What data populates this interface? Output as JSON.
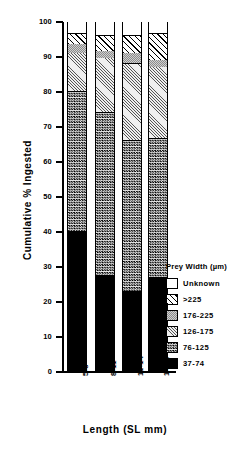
{
  "chart_data": {
    "type": "bar",
    "subtype": "stacked-100-percent",
    "title": "",
    "xlabel": "Length (SL mm)",
    "ylabel": "Cumulative % Ingested",
    "categories": [
      "5-8",
      "8-11",
      "11-14",
      "14-17"
    ],
    "ylim": [
      0,
      100
    ],
    "ytick_labels": [
      "0",
      "10",
      "20",
      "30",
      "40",
      "50",
      "60",
      "70",
      "80",
      "90",
      "100"
    ],
    "ytick_values": [
      0,
      10,
      20,
      30,
      40,
      50,
      60,
      70,
      80,
      90,
      100
    ],
    "grid": false,
    "legend_position": "right-inside",
    "legend_title": "Prey Width (µm)",
    "series": [
      {
        "name": "Unknown",
        "fill": "white",
        "values": [
          3.5,
          4.0,
          4.0,
          3.5
        ],
        "cumulative_top": [
          100,
          100,
          100,
          100
        ]
      },
      {
        "name": ">225",
        "fill": "diagonal-hatch",
        "values": [
          3.0,
          4.5,
          5.0,
          7.5
        ],
        "cumulative_top": [
          96.5,
          96.0,
          96.0,
          96.5
        ]
      },
      {
        "name": "176-225",
        "fill": "medium-gray",
        "values": [
          2.5,
          2.0,
          3.0,
          2.0
        ],
        "cumulative_top": [
          93.5,
          91.5,
          91.0,
          89.0
        ]
      },
      {
        "name": "126-175",
        "fill": "light-fine-hatch",
        "values": [
          11.0,
          15.5,
          22.0,
          20.5
        ],
        "cumulative_top": [
          91.0,
          89.5,
          88.0,
          87.0
        ]
      },
      {
        "name": "76-125",
        "fill": "dark-stipple",
        "values": [
          40.0,
          46.5,
          43.0,
          39.5
        ],
        "cumulative_top": [
          80.0,
          74.0,
          66.0,
          66.5
        ]
      },
      {
        "name": "37-74",
        "fill": "black",
        "values": [
          40.0,
          27.5,
          23.0,
          27.0
        ],
        "cumulative_top": [
          40.0,
          27.5,
          23.0,
          27.0
        ]
      }
    ]
  },
  "legend": {
    "title": "Prey Width (µm)",
    "items": [
      {
        "label": "Unknown"
      },
      {
        "label": ">225"
      },
      {
        "label": "176-225"
      },
      {
        "label": "126-175"
      },
      {
        "label": "76-125"
      },
      {
        "label": "37-74"
      }
    ]
  },
  "axes": {
    "x_title": "Length (SL mm)",
    "y_title": "Cumulative % Ingested",
    "x_tick_labels": [
      "5-8",
      "8-11",
      "11-14",
      "14-17"
    ],
    "y_tick_labels": [
      "100",
      "90",
      "80",
      "70",
      "60",
      "50",
      "40",
      "30",
      "20",
      "10",
      "0"
    ]
  }
}
